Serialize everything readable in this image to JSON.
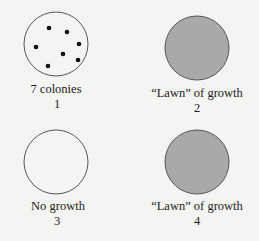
{
  "colors": {
    "background": "#f4f4f2",
    "outline": "#555555",
    "lawn_fill": "#a9a9a9",
    "colony": "#111111"
  },
  "plates": [
    {
      "number": "1",
      "caption": "7 colonies",
      "state": "colonies",
      "colony_count": 7
    },
    {
      "number": "2",
      "caption": "“Lawn” of growth",
      "state": "lawn"
    },
    {
      "number": "3",
      "caption": "No growth",
      "state": "empty"
    },
    {
      "number": "4",
      "caption": "“Lawn” of growth",
      "state": "lawn"
    }
  ]
}
